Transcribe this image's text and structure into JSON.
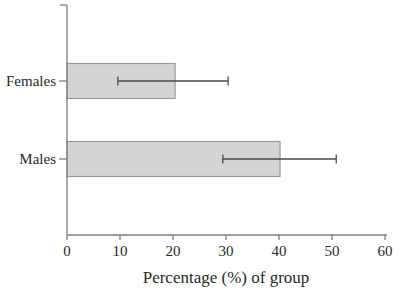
{
  "chart_data": {
    "type": "bar",
    "orientation": "horizontal",
    "title": "",
    "xlabel": "Percentage (%) of group",
    "ylabel": "",
    "categories": [
      "Females",
      "Males"
    ],
    "values": [
      20.4,
      40.2
    ],
    "error_bars": [
      {
        "low": 9.6,
        "high": 30.4
      },
      {
        "low": 29.4,
        "high": 50.8
      }
    ],
    "xlim": [
      0,
      60
    ],
    "xticks": [
      0,
      10,
      20,
      30,
      40,
      50,
      60
    ],
    "grid": false,
    "legend": false,
    "colors": {
      "background": "#ffffff",
      "bar_fill": "#d4d4d4",
      "bar_border": "#9b9b9b",
      "error_bar": "#4a4a4a",
      "axis": "#7d7d7d",
      "text": "#2a2a2a"
    }
  }
}
